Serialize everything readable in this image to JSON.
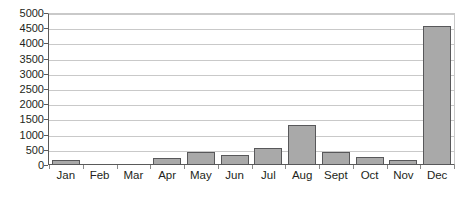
{
  "chart_data": {
    "type": "bar",
    "title": "",
    "subtitle": "",
    "xlabel": "",
    "ylabel": "",
    "categories": [
      "Jan",
      "Feb",
      "Mar",
      "Apr",
      "May",
      "Jun",
      "Jul",
      "Aug",
      "Sept",
      "Oct",
      "Nov",
      "Dec"
    ],
    "values": [
      150,
      0,
      0,
      220,
      420,
      320,
      560,
      1330,
      430,
      270,
      160,
      4580
    ],
    "ylim": [
      0,
      5000
    ],
    "ytick_labels": [
      "5000",
      "4500",
      "4000",
      "3500",
      "3000",
      "2500",
      "2000",
      "1500",
      "1000",
      "500",
      "0"
    ],
    "ytick_values": [
      5000,
      4500,
      4000,
      3500,
      3000,
      2500,
      2000,
      1500,
      1000,
      500,
      0
    ],
    "ytick_step": 500,
    "grid": true,
    "grid_axis": "y",
    "legend": false,
    "legend_position": "none",
    "annotations": [],
    "colors": {
      "bar_fill": "#a9a9a9",
      "bar_border": "#58585a",
      "gridline": "#c9c9c9",
      "axis_line": "#5a5a5a",
      "text": "#231f20",
      "background": "#ffffff"
    }
  }
}
